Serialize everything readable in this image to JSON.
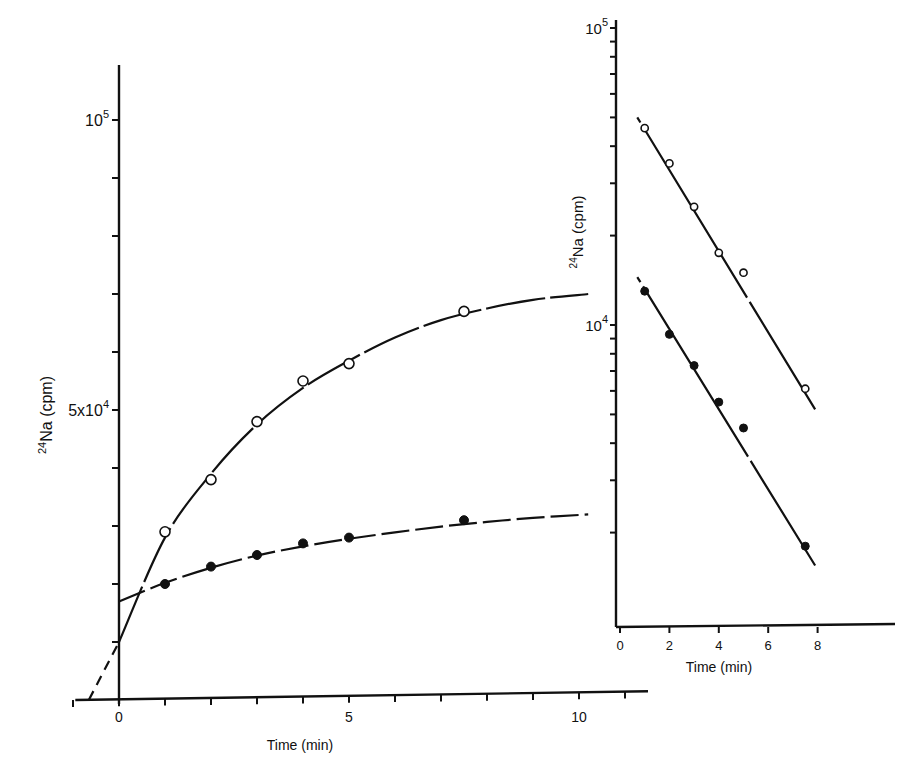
{
  "chart_data": [
    {
      "id": "main",
      "type": "line",
      "title": "",
      "xlabel": "Time (min)",
      "ylabel": "24Na (cpm)",
      "ylabel_parts": {
        "sup": "24",
        "main": "Na (cpm)"
      },
      "xlim": [
        -1,
        11.5
      ],
      "ylim": [
        0,
        110000
      ],
      "yscale": "linear",
      "grid": false,
      "x_ticks": [
        -1,
        0,
        1,
        2,
        3,
        4,
        5,
        6,
        7,
        8,
        9,
        10,
        11
      ],
      "x_tick_labels": [
        {
          "value": 0,
          "label": "0"
        },
        {
          "value": 5,
          "label": "5"
        },
        {
          "value": 10,
          "label": "10"
        }
      ],
      "y_ticks": [
        10000,
        20000,
        30000,
        40000,
        50000,
        60000,
        70000,
        80000,
        90000,
        100000
      ],
      "y_tick_labels": [
        {
          "value": 50000,
          "label": "5x10",
          "sup": "4"
        },
        {
          "value": 100000,
          "label": "10",
          "sup": "5"
        }
      ],
      "series": [
        {
          "name": "open circles",
          "marker": "open-circle",
          "x": [
            1,
            2,
            3,
            4,
            5,
            7.5
          ],
          "y": [
            29000,
            38000,
            48000,
            55000,
            58000,
            67000
          ],
          "fit_curve": {
            "x": [
              0,
              1,
              2,
              3,
              4,
              5,
              6,
              7,
              8,
              9,
              10.2
            ],
            "y": [
              10000,
              28000,
              39000,
              47500,
              53800,
              58500,
              62500,
              65500,
              67500,
              69000,
              70000
            ]
          },
          "extrapolation": {
            "x": [
              -0.7,
              0
            ],
            "y": [
              0,
              10000
            ],
            "style": "dashed"
          }
        },
        {
          "name": "filled circles",
          "marker": "filled-circle",
          "x": [
            1,
            2,
            3,
            4,
            5,
            7.5
          ],
          "y": [
            20000,
            23000,
            25000,
            27000,
            28000,
            31000
          ],
          "fit_curve": {
            "x": [
              0,
              1,
              2,
              3,
              4,
              5,
              6,
              7,
              8,
              9,
              10.2
            ],
            "y": [
              17000,
              20200,
              22800,
              24900,
              26500,
              27800,
              28900,
              29900,
              30700,
              31400,
              32000
            ],
            "style": "dashed"
          }
        }
      ]
    },
    {
      "id": "inset",
      "type": "scatter",
      "title": "",
      "xlabel": "Time (min)",
      "ylabel": "24Na (cpm)",
      "ylabel_parts": {
        "sup": "24",
        "main": "Na (cpm)"
      },
      "xlim": [
        0,
        11
      ],
      "ylim": [
        1000,
        100000
      ],
      "yscale": "log",
      "grid": false,
      "x_ticks": [
        0,
        2,
        4,
        6,
        8
      ],
      "x_tick_labels": [
        {
          "value": 0,
          "label": "0"
        },
        {
          "value": 2,
          "label": "2"
        },
        {
          "value": 4,
          "label": "4"
        },
        {
          "value": 6,
          "label": "6"
        },
        {
          "value": 8,
          "label": "8"
        }
      ],
      "y_ticks": [
        2000,
        3000,
        4000,
        5000,
        6000,
        7000,
        8000,
        9000,
        10000,
        20000,
        30000,
        40000,
        50000,
        60000,
        70000,
        80000,
        90000,
        100000
      ],
      "y_tick_labels": [
        {
          "value": 10000,
          "label": "10",
          "sup": "4"
        },
        {
          "value": 100000,
          "label": "10",
          "sup": "5"
        }
      ],
      "series": [
        {
          "name": "open circles",
          "marker": "open-circle",
          "x": [
            1,
            2,
            3,
            4,
            5,
            7.5
          ],
          "y": [
            46000,
            35000,
            25000,
            17500,
            15000,
            6100
          ],
          "fit_line": {
            "x": [
              0.7,
              7.9
            ],
            "y": [
              50000,
              5200
            ],
            "style": "dashed-ends"
          }
        },
        {
          "name": "filled circles",
          "marker": "filled-circle",
          "x": [
            1,
            2,
            3,
            4,
            5,
            7.5
          ],
          "y": [
            13000,
            9300,
            7300,
            5500,
            4500,
            1800
          ],
          "fit_line": {
            "x": [
              0.7,
              7.9
            ],
            "y": [
              14500,
              1550
            ],
            "style": "dashed-ends"
          }
        }
      ]
    }
  ]
}
